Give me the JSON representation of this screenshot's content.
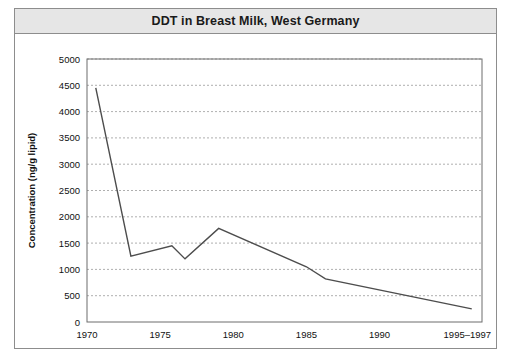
{
  "figure": {
    "title": "DDT in Breast Milk, West Germany"
  },
  "chart_data": {
    "type": "line",
    "title": "DDT in Breast Milk, West Germany",
    "xlabel": "",
    "ylabel": "Concentration (ng/g lipid)",
    "xlim": [
      1970,
      1997
    ],
    "ylim": [
      0,
      5000
    ],
    "grid": true,
    "legend": "none",
    "x_tick_labels": [
      "1970",
      "1975",
      "1980",
      "1985",
      "1990",
      "1995–1997"
    ],
    "x_tick_values": [
      1970,
      1975,
      1980,
      1985,
      1990,
      1996
    ],
    "y_tick_labels": [
      "0",
      "500",
      "1000",
      "1500",
      "2000",
      "2500",
      "3000",
      "3500",
      "4000",
      "4500",
      "5000"
    ],
    "y_tick_values": [
      0,
      500,
      1000,
      1500,
      2000,
      2500,
      3000,
      3500,
      4000,
      4500,
      5000
    ],
    "series": [
      {
        "name": "DDT concentration",
        "color": "#4d4d4d",
        "x": [
          1970.6,
          1973.0,
          1975.8,
          1976.7,
          1979.0,
          1985.0,
          1986.3,
          1996.3
        ],
        "values": [
          4450,
          1250,
          1450,
          1200,
          1780,
          1050,
          820,
          250
        ]
      }
    ]
  }
}
